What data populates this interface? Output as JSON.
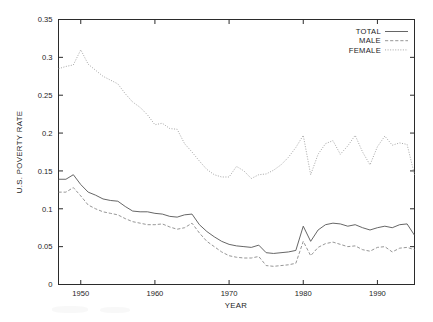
{
  "chart_data": {
    "type": "line",
    "title": "",
    "xlabel": "YEAR",
    "ylabel": "U.S. POVERTY RATE",
    "xlim": [
      1947,
      1995
    ],
    "ylim": [
      0,
      0.35
    ],
    "grid": false,
    "legend_position": "top-right",
    "xticks": [
      1950,
      1960,
      1970,
      1980,
      1990
    ],
    "xtick_labels": [
      "1950",
      "1960",
      "1970",
      "1980",
      "1990"
    ],
    "yticks": [
      0,
      0.05,
      0.1,
      0.15,
      0.2,
      0.25,
      0.3,
      0.35
    ],
    "ytick_labels": [
      "0",
      "0.05",
      "0.1",
      "0.15",
      "0.2",
      "0.25",
      "0.3",
      "0.35"
    ],
    "x": [
      1947,
      1948,
      1949,
      1950,
      1951,
      1952,
      1953,
      1954,
      1955,
      1956,
      1957,
      1958,
      1959,
      1960,
      1961,
      1962,
      1963,
      1964,
      1965,
      1966,
      1967,
      1968,
      1969,
      1970,
      1971,
      1972,
      1973,
      1974,
      1975,
      1976,
      1977,
      1978,
      1979,
      1980,
      1981,
      1982,
      1983,
      1984,
      1985,
      1986,
      1987,
      1988,
      1989,
      1990,
      1991,
      1992,
      1993,
      1994,
      1995
    ],
    "series": [
      {
        "name": "TOTAL",
        "style": "solid",
        "color": "#555555",
        "values": [
          0.139,
          0.139,
          0.145,
          0.132,
          0.122,
          0.118,
          0.113,
          0.111,
          0.11,
          0.103,
          0.097,
          0.096,
          0.096,
          0.094,
          0.093,
          0.09,
          0.089,
          0.092,
          0.093,
          0.079,
          0.07,
          0.063,
          0.057,
          0.053,
          0.051,
          0.05,
          0.049,
          0.052,
          0.042,
          0.041,
          0.042,
          0.043,
          0.045,
          0.077,
          0.057,
          0.072,
          0.079,
          0.081,
          0.08,
          0.077,
          0.079,
          0.075,
          0.072,
          0.075,
          0.077,
          0.075,
          0.079,
          0.08,
          0.065
        ]
      },
      {
        "name": "MALE",
        "style": "dashed",
        "color": "#8a8a8a",
        "values": [
          0.122,
          0.122,
          0.128,
          0.117,
          0.105,
          0.1,
          0.096,
          0.094,
          0.092,
          0.087,
          0.083,
          0.081,
          0.079,
          0.079,
          0.08,
          0.076,
          0.073,
          0.075,
          0.081,
          0.068,
          0.057,
          0.05,
          0.043,
          0.038,
          0.036,
          0.035,
          0.035,
          0.037,
          0.025,
          0.024,
          0.025,
          0.026,
          0.028,
          0.057,
          0.038,
          0.049,
          0.054,
          0.056,
          0.053,
          0.05,
          0.051,
          0.046,
          0.044,
          0.049,
          0.05,
          0.043,
          0.048,
          0.049,
          0.046
        ]
      },
      {
        "name": "FEMALE",
        "style": "dotted",
        "color": "#a0a0a0",
        "values": [
          0.285,
          0.288,
          0.29,
          0.31,
          0.291,
          0.283,
          0.275,
          0.27,
          0.265,
          0.252,
          0.241,
          0.234,
          0.224,
          0.211,
          0.213,
          0.206,
          0.205,
          0.186,
          0.175,
          0.163,
          0.152,
          0.145,
          0.142,
          0.142,
          0.156,
          0.15,
          0.14,
          0.145,
          0.146,
          0.151,
          0.158,
          0.168,
          0.181,
          0.197,
          0.145,
          0.172,
          0.186,
          0.19,
          0.172,
          0.183,
          0.197,
          0.175,
          0.158,
          0.182,
          0.196,
          0.184,
          0.187,
          0.185,
          0.145
        ]
      }
    ]
  },
  "legend": {
    "entries": [
      {
        "label": "TOTAL"
      },
      {
        "label": "MALE"
      },
      {
        "label": "FEMALE"
      }
    ]
  }
}
